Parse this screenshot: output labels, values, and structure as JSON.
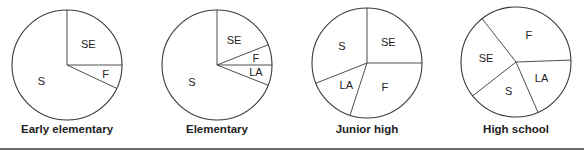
{
  "chart_data": [
    {
      "type": "pie",
      "title": "Early elementary",
      "categories": [
        "SE",
        "F",
        "S"
      ],
      "values": [
        25,
        7,
        68
      ],
      "start_angle_deg": 0,
      "direction": "clockwise"
    },
    {
      "type": "pie",
      "title": "Elementary",
      "categories": [
        "SE",
        "F",
        "LA",
        "S"
      ],
      "values": [
        19,
        6,
        6,
        69
      ],
      "start_angle_deg": 0,
      "direction": "clockwise"
    },
    {
      "type": "pie",
      "title": "Junior high",
      "categories": [
        "SE",
        "F",
        "LA",
        "S"
      ],
      "values": [
        25,
        30,
        14,
        31
      ],
      "start_angle_deg": 0,
      "direction": "clockwise"
    },
    {
      "type": "pie",
      "title": "High school",
      "categories": [
        "F",
        "LA",
        "S",
        "SE"
      ],
      "values": [
        35,
        19,
        21,
        25
      ],
      "start_angle_deg": -38,
      "direction": "clockwise"
    }
  ],
  "layout": {
    "centers": [
      [
        67,
        65
      ],
      [
        217,
        65
      ],
      [
        367,
        63
      ],
      [
        516,
        62
      ]
    ],
    "radius": 55,
    "title_y": 133,
    "stroke": "#3a3a3a",
    "text_color": "#222222",
    "rule_color": "#6e6e6e"
  }
}
